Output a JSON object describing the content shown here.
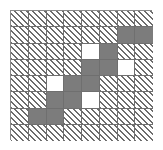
{
  "grid": {
    "columns": 8,
    "rows": 8,
    "origin_x": 10,
    "origin_y": 10,
    "cell_width": 17.75,
    "cell_height": 16.25,
    "border_color": "#8a8a8a",
    "line_color": "#6f6f6f"
  },
  "colors": {
    "hatch_line": "#6d6d6d",
    "hatch_background": "#ffffff",
    "gray_fill": "#7c7c7c",
    "white_fill": "#ffffff",
    "page_background": "#ffffff"
  },
  "chart_data": {
    "type": "heatmap",
    "title": "",
    "xlabel": "",
    "ylabel": "",
    "categories": [
      "c0",
      "c1",
      "c2",
      "c3",
      "c4",
      "c5",
      "c6",
      "c7"
    ],
    "rows": [
      "r0",
      "r1",
      "r2",
      "r3",
      "r4",
      "r5",
      "r6",
      "r7"
    ],
    "legend": [
      {
        "key": "hatch",
        "label": "hatched"
      },
      {
        "key": "gray",
        "label": "gray"
      },
      {
        "key": "white",
        "label": "white"
      }
    ],
    "values": [
      [
        "hatch",
        "hatch",
        "hatch",
        "hatch",
        "hatch",
        "hatch",
        "hatch",
        "hatch"
      ],
      [
        "hatch",
        "hatch",
        "hatch",
        "hatch",
        "hatch",
        "hatch",
        "gray",
        "gray"
      ],
      [
        "hatch",
        "hatch",
        "hatch",
        "hatch",
        "white",
        "gray",
        "hatch",
        "hatch"
      ],
      [
        "hatch",
        "hatch",
        "hatch",
        "hatch",
        "gray",
        "gray",
        "white",
        "hatch"
      ],
      [
        "hatch",
        "hatch",
        "white",
        "gray",
        "gray",
        "hatch",
        "hatch",
        "hatch"
      ],
      [
        "hatch",
        "hatch",
        "gray",
        "gray",
        "white",
        "hatch",
        "hatch",
        "hatch"
      ],
      [
        "hatch",
        "gray",
        "gray",
        "hatch",
        "hatch",
        "hatch",
        "hatch",
        "hatch"
      ],
      [
        "hatch",
        "hatch",
        "hatch",
        "hatch",
        "hatch",
        "hatch",
        "hatch",
        "hatch"
      ]
    ]
  }
}
